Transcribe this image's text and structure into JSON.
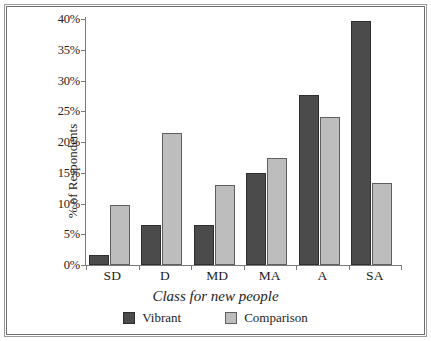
{
  "chart_data": {
    "type": "bar",
    "title": "",
    "xlabel": "Class for new people",
    "ylabel": "% of Respondents",
    "categories": [
      "SD",
      "D",
      "MD",
      "MA",
      "A",
      "SA"
    ],
    "series": [
      {
        "name": "Vibrant",
        "color": "#4b4b4b",
        "values": [
          1.7,
          6.5,
          6.5,
          14.9,
          27.6,
          39.7
        ]
      },
      {
        "name": "Comparison",
        "color": "#bdbdbd",
        "values": [
          9.7,
          21.5,
          13.0,
          17.4,
          24.1,
          13.4
        ]
      }
    ],
    "ylim": [
      0,
      40
    ],
    "ytick_values": [
      0,
      5,
      10,
      15,
      20,
      25,
      30,
      35,
      40
    ],
    "ytick_labels": [
      "0%",
      "5%",
      "10%",
      "15%",
      "20%",
      "25%",
      "30%",
      "35%",
      "40%"
    ],
    "grid": false,
    "legend_position": "bottom"
  },
  "figure": {
    "border_color": "#6f6f6f",
    "background": "#ffffff"
  },
  "axis": {
    "y_title": "% of Respondents",
    "x_title": "Class for new people"
  },
  "legend": {
    "entries": [
      {
        "label": "Vibrant",
        "swatch": "legend-swatch-vibrant"
      },
      {
        "label": "Comparison",
        "swatch": "legend-swatch-comparison"
      }
    ]
  }
}
